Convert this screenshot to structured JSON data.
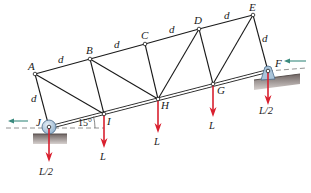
{
  "diagram": {
    "type": "truss",
    "angle_label": "15°",
    "member_length_label": "d",
    "joints": {
      "A": {
        "label": "A"
      },
      "B": {
        "label": "B"
      },
      "C": {
        "label": "C"
      },
      "D": {
        "label": "D"
      },
      "E": {
        "label": "E"
      },
      "F": {
        "label": "F"
      },
      "G": {
        "label": "G"
      },
      "H": {
        "label": "H"
      },
      "I": {
        "label": "I"
      },
      "J": {
        "label": "J"
      }
    },
    "dimension_labels": {
      "AB": "d",
      "BC": "d",
      "CD": "d",
      "DE": "d",
      "AJ": "d",
      "EF": "d"
    },
    "loads": {
      "J": "L/2",
      "I": "L",
      "H": "L",
      "G": "L",
      "F": "L/2"
    },
    "colors": {
      "member": "#1a1a1a",
      "load_arrow": "#d9202f",
      "reaction_arrow": "#3a8a7e",
      "support_ground": "#8c8280",
      "support_fill": "#a9c4da"
    }
  }
}
